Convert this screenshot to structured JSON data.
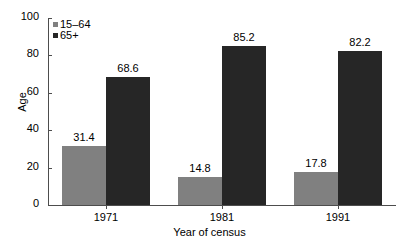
{
  "chart_data": {
    "type": "bar",
    "title": "",
    "xlabel": "Year of census",
    "ylabel": "Age",
    "categories": [
      "1971",
      "1981",
      "1991"
    ],
    "series": [
      {
        "name": "15–64",
        "color": "#808080",
        "values": [
          31.4,
          14.8,
          17.8
        ]
      },
      {
        "name": "65+",
        "color": "#262626",
        "values": [
          68.6,
          85.2,
          82.2
        ]
      }
    ],
    "ylim": [
      0,
      100
    ],
    "yticks": [
      0,
      20,
      40,
      60,
      80,
      100
    ],
    "ytick_labels": [
      "0",
      "20",
      "40",
      "60",
      "80",
      "100"
    ],
    "grid": false,
    "legend_position": "top-left",
    "data_labels": [
      "31.4",
      "68.6",
      "14.8",
      "85.2",
      "17.8",
      "82.2"
    ]
  },
  "axes": {
    "y_title": "Age",
    "x_title": "Year of census"
  },
  "legend": {
    "items": [
      {
        "label": "15–64",
        "color": "#808080"
      },
      {
        "label": "65+",
        "color": "#262626"
      }
    ]
  }
}
